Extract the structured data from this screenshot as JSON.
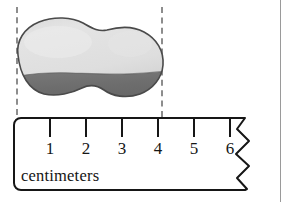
{
  "figure": {
    "background_color": "#ffffff",
    "border_color": "#9a9a9a"
  },
  "object": {
    "name": "rock",
    "shape": "irregular-blob",
    "top_fill_color": "#e2e2e2",
    "bottom_fill_color": "#6d6d6d",
    "outline_color": "#4a4a4a",
    "left_edge_cm": 0,
    "right_edge_cm": 4,
    "measured_length_cm": 4
  },
  "guides": {
    "color": "#8d8d8d",
    "style": "dashed",
    "left_label": "left edge alignment",
    "right_label": "right edge alignment"
  },
  "ruler": {
    "unit_label": "centimeters",
    "outline_color": "#161616",
    "fill_color": "#ffffff",
    "broken_right_edge": true,
    "zero_at_left_edge": true,
    "tick_color": "#161616",
    "ticks": [
      {
        "label": "1",
        "x": 50
      },
      {
        "label": "2",
        "x": 86
      },
      {
        "label": "3",
        "x": 122
      },
      {
        "label": "4",
        "x": 158
      },
      {
        "label": "5",
        "x": 194
      },
      {
        "label": "6",
        "x": 230
      }
    ]
  }
}
